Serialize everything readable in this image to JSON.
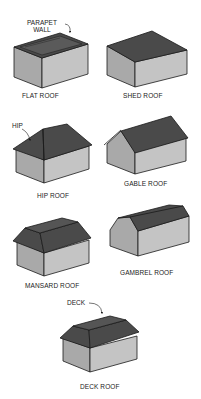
{
  "figure": {
    "colors": {
      "roof": "#4a4a4a",
      "wall_front": "#c4c4c4",
      "wall_side": "#a9a9a9",
      "outline": "#1a1a1a",
      "background": "#ffffff"
    },
    "roofs": [
      {
        "name": "FLAT ROOF",
        "callout": "PARAPET\nWALL"
      },
      {
        "name": "SHED ROOF"
      },
      {
        "name": "HIP ROOF",
        "callout": "HIP"
      },
      {
        "name": "GABLE ROOF"
      },
      {
        "name": "MANSARD ROOF"
      },
      {
        "name": "GAMBREL ROOF"
      },
      {
        "name": "DECK ROOF",
        "callout": "DECK"
      }
    ],
    "callouts": {
      "parapet_line1": "PARAPET",
      "parapet_line2": "WALL",
      "hip": "HIP",
      "deck": "DECK"
    }
  }
}
